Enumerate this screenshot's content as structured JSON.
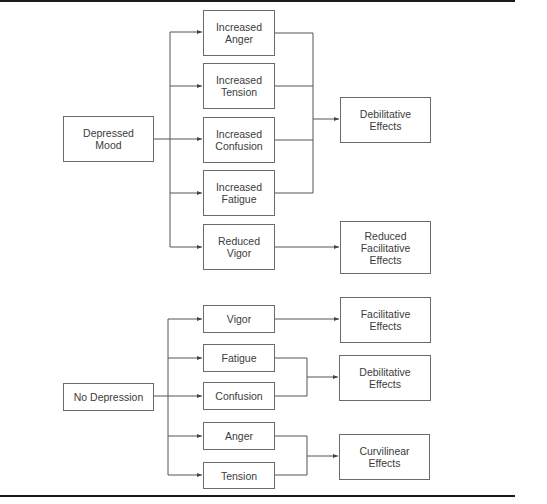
{
  "diagram": {
    "top_section": {
      "source": {
        "label": "Depressed\nMood"
      },
      "mood_states": [
        {
          "label": "Increased\nAnger"
        },
        {
          "label": "Increased\nTension"
        },
        {
          "label": "Increased\nConfusion"
        },
        {
          "label": "Increased\nFatigue"
        },
        {
          "label": "Reduced\nVigor"
        }
      ],
      "outcomes": [
        {
          "label": "Debilitative\nEffects",
          "from": [
            "Increased Anger",
            "Increased Tension",
            "Increased Confusion",
            "Increased Fatigue"
          ]
        },
        {
          "label": "Reduced\nFacilitative\nEffects",
          "from": [
            "Reduced Vigor"
          ]
        }
      ]
    },
    "bottom_section": {
      "source": {
        "label": "No Depression"
      },
      "mood_states": [
        {
          "label": "Vigor"
        },
        {
          "label": "Fatigue"
        },
        {
          "label": "Confusion"
        },
        {
          "label": "Anger"
        },
        {
          "label": "Tension"
        }
      ],
      "outcomes": [
        {
          "label": "Facilitative\nEffects",
          "from": [
            "Vigor"
          ]
        },
        {
          "label": "Debilitative\nEffects",
          "from": [
            "Fatigue",
            "Confusion"
          ]
        },
        {
          "label": "Curvilinear\nEffects",
          "from": [
            "Anger",
            "Tension"
          ]
        }
      ]
    },
    "colors": {
      "line": "#555555",
      "border": "#6b6b6b",
      "text": "#3c3c3c",
      "rule": "#1a1a1a"
    }
  }
}
